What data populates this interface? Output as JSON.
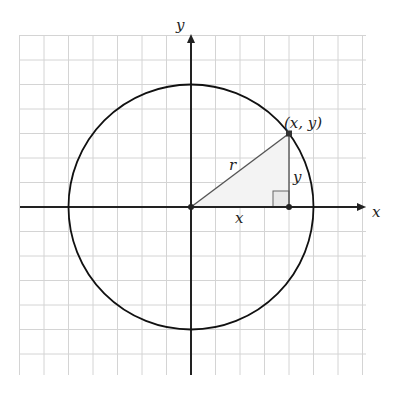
{
  "chart_data": {
    "type": "diagram",
    "grid": {
      "on": true,
      "xmin": -7,
      "xmax": 7,
      "ymin": -7,
      "ymax": 7,
      "step": 1
    },
    "axes": {
      "x_label": "x",
      "y_label": "y"
    },
    "circle": {
      "center": [
        0,
        0
      ],
      "radius": 5
    },
    "point": {
      "x": 4,
      "y": 3,
      "label": "(x, y)"
    },
    "segments": [
      {
        "from": [
          0,
          0
        ],
        "to": [
          4,
          3
        ],
        "label": "r"
      },
      {
        "from": [
          4,
          0
        ],
        "to": [
          4,
          3
        ],
        "label": "y"
      },
      {
        "from": [
          0,
          0
        ],
        "to": [
          4,
          0
        ],
        "label": "x"
      }
    ],
    "right_angle_marker": [
      4,
      0
    ]
  },
  "labels": {
    "x_axis": "x",
    "y_axis": "y",
    "point": "(x, y)",
    "hypotenuse": "r",
    "opposite": "y",
    "adjacent": "x"
  },
  "colors": {
    "grid": "#d4d4d4",
    "axis": "#222222",
    "circle": "#111111",
    "segment": "#555555",
    "triangle_fill": "#f3f3f3"
  }
}
